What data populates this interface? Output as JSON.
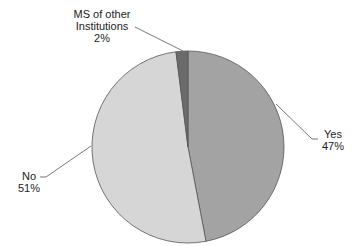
{
  "chart_data": {
    "type": "pie",
    "title": "",
    "categories": [
      "Yes",
      "No",
      "MS of other Institutions"
    ],
    "values": [
      47,
      51,
      2
    ],
    "unit": "%",
    "labels": [
      {
        "name": "Yes",
        "value": "47%"
      },
      {
        "name": "No",
        "value": "51%"
      },
      {
        "name_line1": "MS of other",
        "name_line2": "Institutions",
        "value": "2%"
      }
    ],
    "colors": [
      "#a3a3a3",
      "#d6d6d6",
      "#6b6b6b"
    ],
    "legend": "none",
    "label_position": "outside with leader lines"
  }
}
